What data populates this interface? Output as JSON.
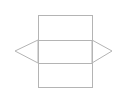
{
  "diagram": {
    "type": "triangular-prism-net",
    "stroke_color": "#b4b4b4",
    "background": "#ffffff",
    "faces": {
      "top_rectangle": {
        "x": 38,
        "y": 15,
        "width": 54,
        "height": 25
      },
      "middle_rectangle": {
        "x": 38,
        "y": 40,
        "width": 54,
        "height": 23
      },
      "bottom_rectangle": {
        "x": 38,
        "y": 63,
        "width": 54,
        "height": 24
      },
      "left_triangle": {
        "points": "38,40 15,51 38,63"
      },
      "right_triangle": {
        "points": "92,40 112,51 92,63"
      }
    }
  }
}
